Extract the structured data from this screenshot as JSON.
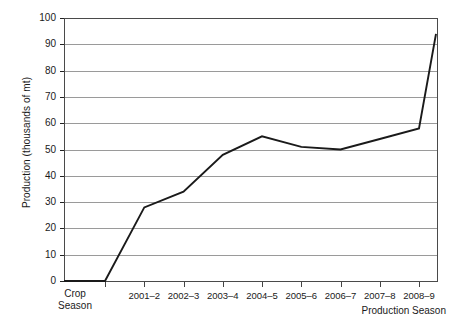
{
  "chart_data": {
    "type": "line",
    "title": "",
    "xlabel": "Production Season",
    "ylabel": "Production (thousands of mt)",
    "secondary_xlabel_line1": "Crop",
    "secondary_xlabel_line2": "Season",
    "categories": [
      "2000–1",
      "2001–2",
      "2002–3",
      "2003–4",
      "2004–5",
      "2005–6",
      "2006–7",
      "2007–8",
      "2008–9"
    ],
    "tick_labels": [
      "",
      "2001–2",
      "2002–3",
      "2003–4",
      "2004–5",
      "2005–6",
      "2006–7",
      "2007–8",
      "2008–9"
    ],
    "values": [
      0,
      28,
      34,
      48,
      55,
      51,
      50,
      54,
      58
    ],
    "baseline_start_value": 0,
    "end_value": 94,
    "ylim": [
      0,
      100
    ],
    "ytick_labels": [
      "100",
      "90",
      "80",
      "70",
      "60",
      "50",
      "40",
      "30",
      "20",
      "10",
      "0"
    ],
    "ytick_values": [
      100,
      90,
      80,
      70,
      60,
      50,
      40,
      30,
      20,
      10,
      0
    ],
    "ytick_step": 10,
    "grid": true,
    "grid_axis": "y",
    "legend": false,
    "legend_position": "none",
    "series": [
      {
        "name": "Production",
        "values": [
          0,
          28,
          34,
          48,
          55,
          51,
          50,
          54,
          58
        ]
      }
    ],
    "colors": {
      "line": "#1a1a1a",
      "grid": "#9a9a9a",
      "axis": "#4a4a4a",
      "background": "#ffffff",
      "text": "#1a1a1a"
    }
  }
}
